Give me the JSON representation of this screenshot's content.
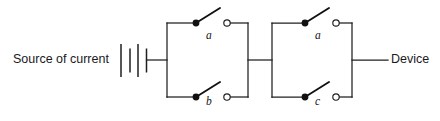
{
  "figure": {
    "type": "circuit-diagram",
    "background_color": "#ffffff",
    "line_color": "#1f1f22",
    "width": 440,
    "height": 121
  },
  "labels": {
    "source": "Source of current",
    "device": "Device"
  },
  "components": [
    {
      "id": "battery",
      "name": "current-source-battery",
      "kind": "battery",
      "cells": 3,
      "x": 120,
      "y": 60
    }
  ],
  "switch_groups": [
    {
      "id": "group-1",
      "name": "switch-group-left",
      "switches": [
        {
          "id": "switch-a1",
          "label": "a",
          "position": "upper",
          "state": "open",
          "pivot": [
            196,
            23
          ],
          "terminal": [
            227,
            23
          ]
        },
        {
          "id": "switch-b",
          "label": "b",
          "position": "lower",
          "state": "open",
          "pivot": [
            196,
            97
          ],
          "terminal": [
            227,
            97
          ]
        }
      ]
    },
    {
      "id": "group-2",
      "name": "switch-group-right",
      "switches": [
        {
          "id": "switch-a2",
          "label": "a",
          "position": "upper",
          "state": "open",
          "pivot": [
            305,
            23
          ],
          "terminal": [
            336,
            23
          ]
        },
        {
          "id": "switch-c",
          "label": "c",
          "position": "lower",
          "state": "open",
          "pivot": [
            305,
            97
          ],
          "terminal": [
            336,
            97
          ]
        }
      ]
    }
  ],
  "nodes": {
    "battery_right_x": 152,
    "left_bus_x": 167,
    "mid_bus_left_x": 248,
    "mid_bus_right_x": 272,
    "right_bus_x": 352,
    "device_wire_end_x": 388,
    "top_rail_y": 23,
    "mid_rail_y": 60,
    "bottom_rail_y": 97
  },
  "switch_label_text": {
    "a_upper_left": "a",
    "b_lower_left": "b",
    "a_upper_right": "a",
    "c_lower_right": "c"
  }
}
